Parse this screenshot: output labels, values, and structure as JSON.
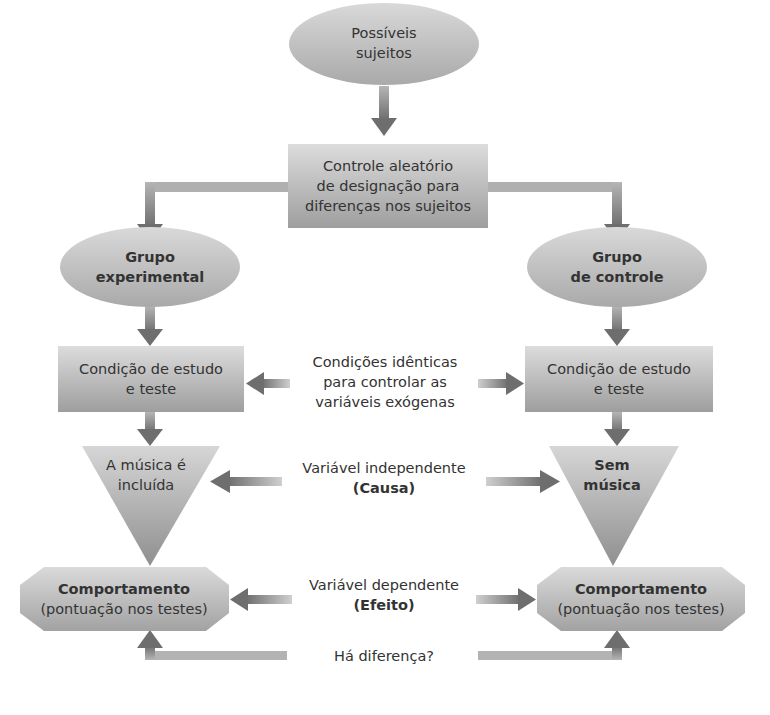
{
  "diagram": {
    "nodes": {
      "subjects": {
        "lines": [
          "Possíveis",
          "sujeitos"
        ],
        "shape": "ellipse"
      },
      "random_assignment": {
        "lines": [
          "Controle aleatório",
          "de designação para",
          "diferenças nos sujeitos"
        ],
        "shape": "rectangle"
      },
      "experimental_group": {
        "lines": [
          "Grupo",
          "experimental"
        ],
        "shape": "ellipse"
      },
      "control_group": {
        "lines": [
          "Grupo",
          "de controle"
        ],
        "shape": "ellipse"
      },
      "study_condition_left": {
        "lines": [
          "Condição de estudo",
          "e teste"
        ],
        "shape": "rectangle"
      },
      "study_condition_right": {
        "lines": [
          "Condição de estudo",
          "e teste"
        ],
        "shape": "rectangle"
      },
      "music_included": {
        "lines": [
          "A música é",
          "incluída"
        ],
        "shape": "inverted-triangle"
      },
      "no_music": {
        "lines": [
          "Sem",
          "música"
        ],
        "shape": "inverted-triangle"
      },
      "behavior_left": {
        "lines": [
          "Comportamento",
          "(pontuação nos testes)"
        ],
        "shape": "octagon"
      },
      "behavior_right": {
        "lines": [
          "Comportamento",
          "(pontuação nos testes)"
        ],
        "shape": "octagon"
      }
    },
    "annotations": {
      "identical_conditions": {
        "lines": [
          "Condições idênticas",
          "para controlar as",
          "variáveis exógenas"
        ]
      },
      "independent_variable": {
        "lines": [
          "Variável independente",
          "(Causa)"
        ]
      },
      "dependent_variable": {
        "lines": [
          "Variável dependente",
          "(Efeito)"
        ]
      },
      "difference_question": {
        "lines": [
          "Há diferença?"
        ]
      }
    },
    "colors": {
      "shape_fill_light": "#d4d4d4",
      "shape_fill_dark": "#9a9a9a",
      "arrow": "#7a7a7a",
      "arrow_light": "#b8b8b8",
      "text": "#333333",
      "background": "#ffffff"
    }
  }
}
